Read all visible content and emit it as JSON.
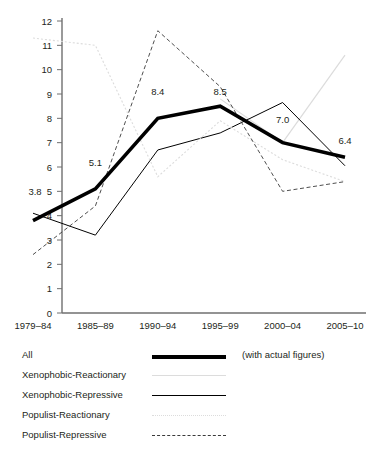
{
  "chart_data": {
    "type": "line",
    "title": "",
    "xlabel": "",
    "ylabel": "",
    "ylim": [
      0,
      12
    ],
    "ytick_values": [
      0,
      1,
      2,
      3,
      4,
      5,
      6,
      7,
      8,
      9,
      10,
      11,
      12
    ],
    "grid": false,
    "legend_position": "below",
    "categories": [
      "1979–84",
      "1985–89",
      "1990–94",
      "1995–99",
      "2000–04",
      "2005–10"
    ],
    "series": [
      {
        "name": "All",
        "style": "thick-solid-black",
        "color": "#000000",
        "values": [
          3.8,
          5.1,
          8.0,
          8.5,
          7.0,
          6.4
        ],
        "data_labels": [
          "3.8",
          "5.1",
          "8.4",
          "8.5",
          "7.0",
          "6.4"
        ]
      },
      {
        "name": "Xenophobic-Reactionary",
        "style": "thin-solid-lightgray",
        "color": "#d9d9d9",
        "values": [
          null,
          null,
          null,
          8.8,
          7.0,
          10.6
        ]
      },
      {
        "name": "Xenophobic-Repressive",
        "style": "thin-solid-black",
        "color": "#000000",
        "values": [
          4.1,
          3.2,
          6.7,
          7.4,
          8.65,
          6.05
        ]
      },
      {
        "name": "Populist-Reactionary",
        "style": "dotted-lightgray",
        "color": "#d9d9d9",
        "values": [
          11.3,
          11.0,
          5.6,
          7.9,
          6.3,
          5.4
        ]
      },
      {
        "name": "Populist-Repressive",
        "style": "dashed-black",
        "color": "#000000",
        "values": [
          2.4,
          4.4,
          11.6,
          9.3,
          5.0,
          5.4
        ]
      }
    ],
    "annotations": [
      {
        "text": "3.8",
        "x_index": 0,
        "y": 4.85
      },
      {
        "text": "5.1",
        "x_index": 1,
        "y": 6.05
      },
      {
        "text": "8.4",
        "x_index": 2,
        "y": 8.95
      },
      {
        "text": "8.5",
        "x_index": 3,
        "y": 8.95
      },
      {
        "text": "7.0",
        "x_index": 4,
        "y": 7.8
      },
      {
        "text": "6.4",
        "x_index": 5,
        "y": 6.95
      }
    ]
  },
  "legend": {
    "rows": [
      {
        "label": "All",
        "style": "thick-solid-black",
        "note": "(with actual figures)"
      },
      {
        "label": "Xenophobic-Reactionary",
        "style": "thin-solid-lightgray",
        "note": ""
      },
      {
        "label": "Xenophobic-Repressive",
        "style": "thin-solid-black",
        "note": ""
      },
      {
        "label": "Populist-Reactionary",
        "style": "dotted-lightgray",
        "note": ""
      },
      {
        "label": "Populist-Repressive",
        "style": "dashed-black",
        "note": ""
      }
    ]
  },
  "axis": {
    "y_labels": [
      "12",
      "11",
      "10",
      "9",
      "8",
      "7",
      "6",
      "5",
      "4",
      "3",
      "2",
      "1",
      "0"
    ],
    "x_labels": [
      "1979–84",
      "1985–89",
      "1990–94",
      "1995–99",
      "2000–04",
      "2005–10"
    ]
  },
  "colors": {
    "axis": "#6f6f6f",
    "ink": "#231f20",
    "light_gray": "#dcdcdc"
  }
}
